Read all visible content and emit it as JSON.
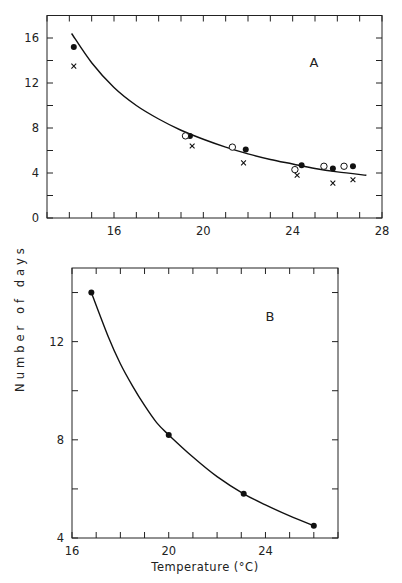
{
  "figure": {
    "ylabel": "Number of days",
    "xlabel": "Temperature (°C)"
  },
  "chart_data": [
    {
      "panel": "A",
      "type": "scatter",
      "title": "A",
      "xlabel": "",
      "ylabel": "Number of days",
      "xlim": [
        13,
        28
      ],
      "ylim": [
        0,
        18
      ],
      "xticks": [
        16,
        20,
        24,
        28
      ],
      "yticks": [
        0,
        4,
        8,
        12,
        16
      ],
      "grid": false,
      "series": [
        {
          "name": "filled circles",
          "marker": "filled-circle",
          "x": [
            14.2,
            19.4,
            21.9,
            24.4,
            25.8,
            26.7
          ],
          "y": [
            15.2,
            7.3,
            6.1,
            4.7,
            4.4,
            4.6
          ]
        },
        {
          "name": "open circles",
          "marker": "open-circle",
          "x": [
            19.2,
            21.3,
            24.1,
            25.4,
            26.3
          ],
          "y": [
            7.3,
            6.3,
            4.3,
            4.6,
            4.6
          ]
        },
        {
          "name": "crosses",
          "marker": "cross",
          "x": [
            14.2,
            19.5,
            21.8,
            24.2,
            25.8,
            26.7
          ],
          "y": [
            13.5,
            6.4,
            4.9,
            3.8,
            3.1,
            3.4
          ]
        },
        {
          "name": "fitted curve",
          "marker": "line",
          "x": [
            14.1,
            15,
            16,
            17,
            18,
            19,
            20,
            21,
            22,
            23,
            24,
            25,
            26,
            27.3
          ],
          "y": [
            16.4,
            13.8,
            11.6,
            10.0,
            8.8,
            7.8,
            7.0,
            6.3,
            5.7,
            5.2,
            4.8,
            4.4,
            4.1,
            3.8
          ]
        }
      ]
    },
    {
      "panel": "B",
      "type": "line",
      "title": "B",
      "xlabel": "Temperature (°C)",
      "ylabel": "Number of days",
      "xlim": [
        16,
        27
      ],
      "ylim": [
        4,
        15
      ],
      "xticks": [
        16,
        20,
        24
      ],
      "yticks": [
        4,
        8,
        12
      ],
      "grid": false,
      "series": [
        {
          "name": "filled circles",
          "marker": "filled-circle",
          "x": [
            16.8,
            20.0,
            23.1,
            26.0
          ],
          "y": [
            14.0,
            8.2,
            5.8,
            4.5
          ]
        },
        {
          "name": "fitted curve",
          "marker": "line",
          "x": [
            16.8,
            17.5,
            18,
            18.5,
            19,
            19.5,
            20,
            21,
            22,
            23.1,
            24,
            25,
            26.0
          ],
          "y": [
            14.0,
            12.2,
            11.1,
            10.2,
            9.4,
            8.7,
            8.2,
            7.3,
            6.5,
            5.8,
            5.35,
            4.9,
            4.5
          ]
        }
      ]
    }
  ]
}
